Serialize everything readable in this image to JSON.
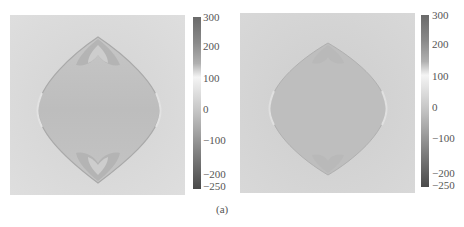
{
  "figure": {
    "caption": "(a)",
    "panels": [
      {
        "id": "left",
        "description": "Grayscale field map with lens/diamond-shaped darker region and darker lobes at top and bottom tips",
        "colorbar": {
          "ticks": [
            "300",
            "200",
            "100",
            "0",
            "−100",
            "−200",
            "−250"
          ],
          "range": [
            -250,
            300
          ]
        }
      },
      {
        "id": "right",
        "description": "Grayscale field map with lens/diamond-shaped darker region, smoother lobes",
        "colorbar": {
          "ticks": [
            "300",
            "200",
            "100",
            "0",
            "−100",
            "−200",
            "−250"
          ],
          "range": [
            -250,
            300
          ]
        }
      }
    ]
  },
  "colors": {
    "background": "#ffffff",
    "field_bg": "#d6d6d6",
    "lens_fill": "#bcbcbc",
    "edge_dark": "#a8a8a8",
    "text": "#555555"
  }
}
